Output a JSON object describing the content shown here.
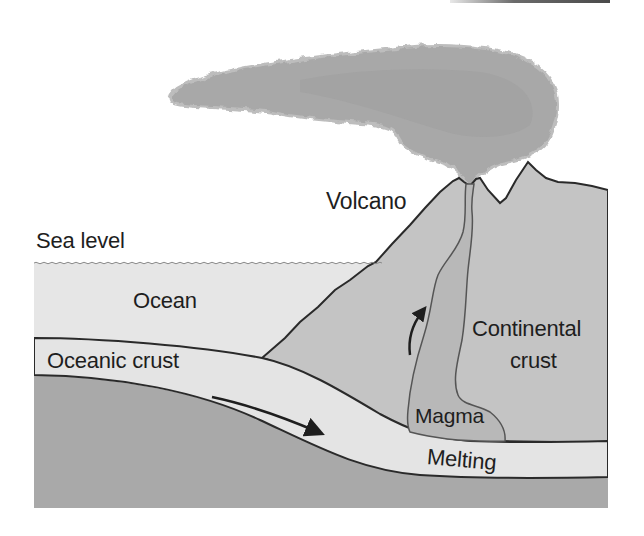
{
  "figure": {
    "colors": {
      "background": "#ffffff",
      "ocean": "#e6e6e6",
      "continental_crust": "#c4c4c4",
      "oceanic_crust": "#e4e4e4",
      "mantle": "#a9a9a9",
      "magma": "#b8b8b8",
      "ash_cloud": "#a8a8a8",
      "outline": "#2a2a2a",
      "text": "#1e1e1e"
    }
  },
  "labels": {
    "volcano": "Volcano",
    "sea_level": "Sea level",
    "ocean": "Ocean",
    "oceanic_crust": "Oceanic crust",
    "continental_crust_line1": "Continental",
    "continental_crust_line2": "crust",
    "magma": "Magma",
    "melting": "Melting"
  },
  "arrows": {
    "subduction": "down-right along oceanic crust",
    "magma_rise": "upward through conduit"
  }
}
